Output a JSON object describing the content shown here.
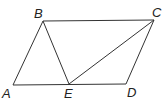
{
  "diagram": {
    "type": "parallelogram",
    "points": {
      "A": {
        "label": "A",
        "x": 13,
        "y": 85
      },
      "B": {
        "label": "B",
        "x": 43,
        "y": 21
      },
      "C": {
        "label": "C",
        "x": 154,
        "y": 20
      },
      "D": {
        "label": "D",
        "x": 126,
        "y": 84
      },
      "E": {
        "label": "E",
        "x": 69,
        "y": 84
      }
    },
    "segments": [
      "AB",
      "BC",
      "CD",
      "DA",
      "BE",
      "EC"
    ],
    "colors": {
      "line": "#333333",
      "text": "#222222"
    }
  }
}
